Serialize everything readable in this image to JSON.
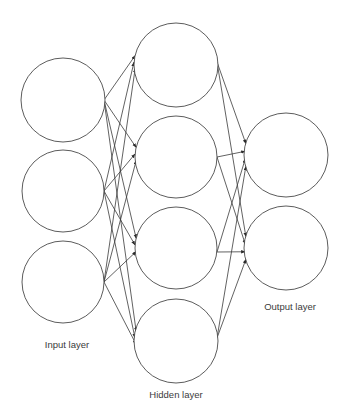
{
  "diagram": {
    "type": "feedforward-neural-network",
    "canvas": {
      "width": 347,
      "height": 413,
      "background": "#ffffff"
    },
    "style": {
      "node_stroke": "#4a4a4a",
      "node_fill": "#ffffff",
      "edge_stroke": "#3a3a3a",
      "label_color": "#3b3b3b",
      "node_stroke_width": 0.9,
      "edge_stroke_width": 0.8
    },
    "labels": {
      "input": "Input layer",
      "hidden": "Hidden layer",
      "output": "Output layer"
    },
    "label_positions": {
      "input": {
        "x": 67,
        "y": 345
      },
      "hidden": {
        "x": 176,
        "y": 395
      },
      "output": {
        "x": 290,
        "y": 307
      }
    },
    "layers": [
      {
        "name": "input",
        "label": "Input layer",
        "count": 3,
        "nodes": [
          {
            "id": "i1",
            "cx": 63,
            "cy": 100,
            "r": 42
          },
          {
            "id": "i2",
            "cx": 63,
            "cy": 191,
            "r": 41
          },
          {
            "id": "i3",
            "cx": 63,
            "cy": 282,
            "r": 41
          }
        ]
      },
      {
        "name": "hidden",
        "label": "Hidden layer",
        "count": 4,
        "nodes": [
          {
            "id": "h1",
            "cx": 176,
            "cy": 65,
            "r": 42
          },
          {
            "id": "h2",
            "cx": 176,
            "cy": 157,
            "r": 41
          },
          {
            "id": "h3",
            "cx": 176,
            "cy": 248,
            "r": 41
          },
          {
            "id": "h4",
            "cx": 176,
            "cy": 341,
            "r": 42
          }
        ]
      },
      {
        "name": "output",
        "label": "Output layer",
        "count": 2,
        "nodes": [
          {
            "id": "o1",
            "cx": 286,
            "cy": 155,
            "r": 42
          },
          {
            "id": "o2",
            "cx": 286,
            "cy": 248,
            "r": 42
          }
        ]
      }
    ],
    "connections": {
      "input_to_hidden": "fully-connected",
      "hidden_to_output": "fully-connected",
      "input_exit_points": [
        {
          "x": 104,
          "y": 100
        },
        {
          "x": 104,
          "y": 191
        },
        {
          "x": 104,
          "y": 282
        }
      ],
      "hidden_entry_points": [
        {
          "x": 134,
          "y": 62
        },
        {
          "x": 135,
          "y": 154
        },
        {
          "x": 135,
          "y": 245
        },
        {
          "x": 135,
          "y": 338
        }
      ],
      "hidden_exit_points": [
        {
          "x": 217,
          "y": 62
        },
        {
          "x": 217,
          "y": 157
        },
        {
          "x": 217,
          "y": 252
        },
        {
          "x": 217,
          "y": 338
        }
      ],
      "output_entry_points": [
        {
          "x": 245,
          "y": 155
        },
        {
          "x": 245,
          "y": 248
        }
      ],
      "arrowheads": true,
      "total_edges": 20
    }
  }
}
